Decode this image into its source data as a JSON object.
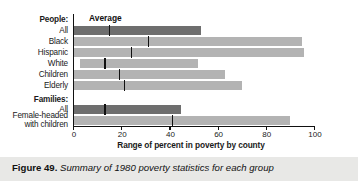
{
  "figure": {
    "caption_label": "Figure 49.",
    "caption_text": "Summary of 1980 poverty statistics for each group",
    "average_annotation": "Average"
  },
  "colors": {
    "bar_light": "#b3b3b3",
    "bar_dark": "#6e6e6e",
    "tick": "#111111",
    "axis": "#111111",
    "caption_band": "#e8e8e6",
    "background": "#ffffff"
  },
  "chart_data": {
    "type": "bar",
    "title": "",
    "subtitle": "",
    "xlabel": "Range of percent in poverty by county",
    "ylabel": "",
    "xlim": [
      0,
      100
    ],
    "xticks": [
      0,
      20,
      40,
      60,
      80,
      100
    ],
    "xtick_labels": [
      "0",
      "20",
      "40",
      "60",
      "80",
      "100"
    ],
    "grid": false,
    "legend": null,
    "annotations": [
      "Average"
    ],
    "orientation": "horizontal",
    "note": "Each bar is a floating range (min to max percent in poverty by county); the vertical tick inside each bar marks the average.",
    "group_headings": [
      {
        "label": "People:",
        "before_row": 0
      },
      {
        "label": "Families:",
        "before_row": 6
      }
    ],
    "categories": [
      "All",
      "Black",
      "Hispanic",
      "White",
      "Children",
      "Elderly",
      "All",
      "Female-headed with children"
    ],
    "rows": [
      {
        "group": "People",
        "label": "All",
        "label_lines": [
          "All"
        ],
        "range_min": 0,
        "range_max": 53,
        "average": 15,
        "shade": "dark"
      },
      {
        "group": "People",
        "label": "Black",
        "label_lines": [
          "Black"
        ],
        "range_min": 0,
        "range_max": 95,
        "average": 31,
        "shade": "light"
      },
      {
        "group": "People",
        "label": "Hispanic",
        "label_lines": [
          "Hispanic"
        ],
        "range_min": 0,
        "range_max": 96,
        "average": 24,
        "shade": "light"
      },
      {
        "group": "People",
        "label": "White",
        "label_lines": [
          "White"
        ],
        "range_min": 3,
        "range_max": 52,
        "average": 13,
        "shade": "light"
      },
      {
        "group": "People",
        "label": "Children",
        "label_lines": [
          "Children"
        ],
        "range_min": 0,
        "range_max": 63,
        "average": 19,
        "shade": "light"
      },
      {
        "group": "People",
        "label": "Elderly",
        "label_lines": [
          "Elderly"
        ],
        "range_min": 0,
        "range_max": 70,
        "average": 21,
        "shade": "light"
      },
      {
        "group": "Families",
        "label": "All",
        "label_lines": [
          "All"
        ],
        "range_min": 0,
        "range_max": 45,
        "average": 13,
        "shade": "dark"
      },
      {
        "group": "Families",
        "label": "Female-headed with children",
        "label_lines": [
          "Female-headed",
          "with children"
        ],
        "range_min": 0,
        "range_max": 90,
        "average": 41,
        "shade": "light"
      }
    ]
  }
}
